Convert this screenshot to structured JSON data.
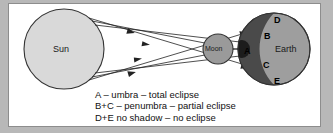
{
  "diagram": {
    "bodies": {
      "sun": {
        "label": "Sun",
        "fill": "#d9d9d9",
        "stroke": "#333333"
      },
      "moon": {
        "label": "Moon",
        "fill": "#9a9a9a",
        "stroke": "#333333"
      },
      "earth": {
        "label": "Earth",
        "fill": "#9e9e9e",
        "stroke": "#333333"
      }
    },
    "zones": [
      {
        "id": "A",
        "label": "A",
        "meaning": "umbra",
        "fill": "#1c1c1c"
      },
      {
        "id": "B",
        "label": "B",
        "meaning": "penumbra",
        "fill": "#4a4a4a"
      },
      {
        "id": "C",
        "label": "C",
        "meaning": "penumbra",
        "fill": "#4a4a4a"
      },
      {
        "id": "D",
        "label": "D",
        "meaning": "no shadow",
        "fill": "#9e9e9e"
      },
      {
        "id": "E",
        "label": "E",
        "meaning": "no shadow",
        "fill": "#9e9e9e"
      }
    ],
    "rays": {
      "count": 6,
      "color": "#222222",
      "arrowheads": true
    }
  },
  "caption": {
    "lines": [
      "A – umbra – total eclipse",
      "B+C – penumbra – partial eclipse",
      "D+E no shadow – no eclipse"
    ],
    "line1": "A – umbra – total eclipse",
    "line2": "B+C – penumbra – partial eclipse",
    "line3": "D+E no shadow – no eclipse"
  },
  "frame": {
    "outer_color": "#b8b8b8",
    "panel_color": "#ffffff",
    "border_color": "#8d8d8d"
  }
}
